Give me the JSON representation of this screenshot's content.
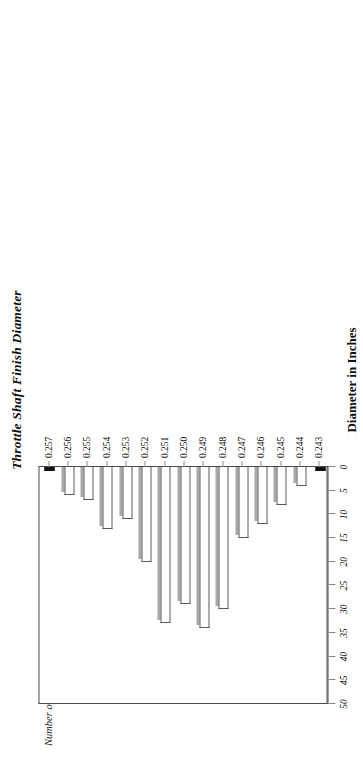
{
  "chart_data": {
    "type": "bar",
    "orientation": "vertical-rotated",
    "title": "Throttle Shaft Finish Diameter",
    "xlabel": "Diameter in Inches",
    "ylabel": "Number of Measurements",
    "categories": [
      "0.243",
      "0.244",
      "0.245",
      "0.246",
      "0.247",
      "0.248",
      "0.249",
      "0.250",
      "0.251",
      "0.252",
      "0.253",
      "0.254",
      "0.255",
      "0.256",
      "0.257"
    ],
    "values": [
      0,
      4,
      8,
      12,
      15,
      30,
      34,
      29,
      33,
      20,
      11,
      13,
      7,
      6,
      0
    ],
    "ylim": [
      0,
      50
    ],
    "ytick_labels": [
      "50",
      "45",
      "40",
      "35",
      "30",
      "25",
      "20",
      "15",
      "10",
      "5",
      "0"
    ],
    "ytick_values": [
      50,
      45,
      40,
      35,
      30,
      25,
      20,
      15,
      10,
      5,
      0
    ],
    "grid": false,
    "legend": "none",
    "bar_fill_color": "#ffffff",
    "bar_border_color": "#5a5a5a",
    "bar_shadow_color": "#a8a8a8",
    "zero_bar_color": "#111111",
    "axis_color": "#4a4a4a"
  }
}
